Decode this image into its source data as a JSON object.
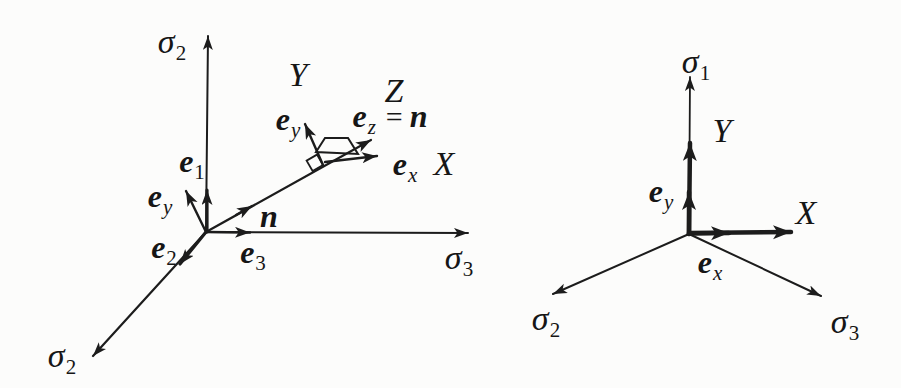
{
  "figure": {
    "ink_color": "#1c1c1c",
    "background": "#fcfcfb"
  },
  "left": {
    "labels": {
      "sigma2_top": {
        "main": "σ",
        "sub": "2"
      },
      "sigma2_bottom": {
        "main": "σ",
        "sub": "2"
      },
      "sigma3": {
        "main": "σ",
        "sub": "3"
      },
      "e1": {
        "main": "e",
        "sub": "1"
      },
      "ey_origin": {
        "main": "e",
        "sub": "y"
      },
      "e2": {
        "main": "e",
        "sub": "2"
      },
      "e3": {
        "main": "e",
        "sub": "3"
      },
      "n": {
        "main": "n"
      },
      "frame_Y": {
        "main": "Y"
      },
      "frame_Z": {
        "main": "Z"
      },
      "frame_ez": {
        "main": "e",
        "sub": "z",
        "eq": "=",
        "val": "n"
      },
      "frame_ey": {
        "main": "e",
        "sub": "y"
      },
      "frame_ex": {
        "main": "e",
        "sub": "x"
      },
      "frame_X": {
        "main": "X"
      }
    }
  },
  "right": {
    "labels": {
      "sigma1": {
        "main": "σ",
        "sub": "1"
      },
      "sigma2": {
        "main": "σ",
        "sub": "2"
      },
      "sigma3": {
        "main": "σ",
        "sub": "3"
      },
      "Y": {
        "main": "Y"
      },
      "X": {
        "main": "X"
      },
      "ey": {
        "main": "e",
        "sub": "y"
      },
      "ex": {
        "main": "e",
        "sub": "x"
      }
    }
  }
}
